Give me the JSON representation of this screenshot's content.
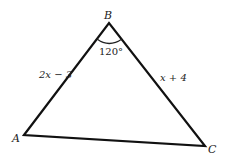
{
  "diagram": {
    "type": "triangle",
    "vertices": {
      "A": {
        "label": "A",
        "x": 24,
        "y": 135
      },
      "B": {
        "label": "B",
        "x": 109,
        "y": 23
      },
      "C": {
        "label": "C",
        "x": 205,
        "y": 146
      }
    },
    "angle_B": {
      "label": "120°"
    },
    "sides": {
      "AB": {
        "label": "2x − 3"
      },
      "BC": {
        "label": "x + 4"
      }
    },
    "stroke_color": "#111111"
  }
}
